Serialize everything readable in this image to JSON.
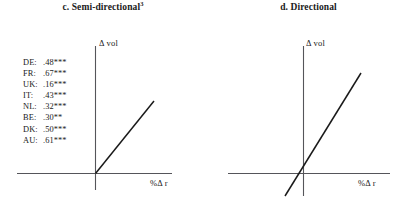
{
  "figure": {
    "panels": [
      {
        "id": "c",
        "title": "c. Semi-directional",
        "title_superscript": "3",
        "y_axis_label": "Δ vol",
        "x_axis_label": "%Δ r",
        "coefficients": [
          {
            "country": "DE:",
            "value": ".48***"
          },
          {
            "country": "FR:",
            "value": ".67***"
          },
          {
            "country": "UK:",
            "value": ".16***"
          },
          {
            "country": "IT:",
            "value": ".43***"
          },
          {
            "country": "NL:",
            "value": ".32***"
          },
          {
            "country": "BE:",
            "value": ".30**"
          },
          {
            "country": "DK:",
            "value": ".50***"
          },
          {
            "country": "AU:",
            "value": ".61***"
          }
        ]
      },
      {
        "id": "d",
        "title": "d. Directional",
        "title_superscript": "",
        "y_axis_label": "Δ vol",
        "x_axis_label": "%Δ r",
        "coefficients": []
      }
    ]
  },
  "chart_data": [
    {
      "type": "line",
      "title": "c. Semi-directional",
      "xlabel": "%Δ r",
      "ylabel": "Δ vol",
      "xlim": [
        -1,
        1
      ],
      "ylim": [
        -0.2,
        1
      ],
      "grid": false,
      "legend": "none",
      "description": "Kinked response: slope is zero for negative %Δ r and positive for positive %Δ r.",
      "series": [
        {
          "name": "semi-directional response",
          "x": [
            0,
            0.62
          ],
          "y": [
            0,
            0.76
          ]
        }
      ],
      "annotations": [
        "DE: .48***",
        "FR: .67***",
        "UK: .16***",
        "IT: .43***",
        "NL: .32***",
        "BE: .30**",
        "DK: .50***",
        "AU: .61***"
      ]
    },
    {
      "type": "line",
      "title": "d. Directional",
      "xlabel": "%Δ r",
      "ylabel": "Δ vol",
      "xlim": [
        -1,
        1
      ],
      "ylim": [
        -0.35,
        1
      ],
      "grid": false,
      "legend": "none",
      "description": "Symmetric linear response through the origin with constant positive slope in both quadrants.",
      "series": [
        {
          "name": "directional response",
          "x": [
            -0.22,
            0.72
          ],
          "y": [
            -0.28,
            0.9
          ]
        }
      ],
      "annotations": []
    }
  ],
  "style": {
    "ink_color": "#1a1a1a",
    "axis_color": "#55555a",
    "background": "#ffffff"
  }
}
